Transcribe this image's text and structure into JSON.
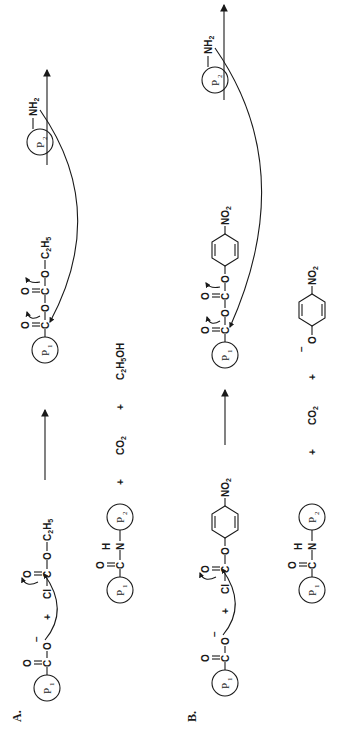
{
  "figure": {
    "orientation": "rotated-90-ccw",
    "panels": [
      {
        "label": "A.",
        "reactants": {
          "carboxylate": {
            "group": "P1",
            "formula": [
              "O",
              "C",
              "O",
              "−"
            ]
          },
          "plus": "+",
          "chloroformate": {
            "formula": [
              "Cl",
              "C",
              "O",
              "O",
              "C2H5"
            ],
            "name": "ethyl chloroformate"
          }
        },
        "intermediate": {
          "mixed_anhydride": {
            "group": "P1",
            "formula": [
              "O",
              "C",
              "O",
              "C",
              "O",
              "O",
              "C2H5"
            ]
          },
          "amine": {
            "group": "P2",
            "formula": "NH2"
          }
        },
        "products": {
          "amide": {
            "left_group": "P1",
            "right_group": "P2",
            "formula": [
              "O",
              "C",
              "N",
              "H"
            ]
          },
          "byproducts": [
            "CO2",
            "C2H5OH"
          ],
          "plus": "+"
        }
      },
      {
        "label": "B.",
        "reactants": {
          "carboxylate": {
            "group": "P1",
            "formula": [
              "O",
              "C",
              "O",
              "−"
            ]
          },
          "plus": "+",
          "chloroformate": {
            "formula": [
              "Cl",
              "C",
              "O",
              "O",
              "C6H4",
              "NO2"
            ],
            "name": "p-nitrophenyl chloroformate"
          }
        },
        "intermediate": {
          "mixed_anhydride": {
            "group": "P1",
            "formula": [
              "O",
              "C",
              "O",
              "C",
              "O",
              "O",
              "C6H4",
              "NO2"
            ]
          },
          "amine": {
            "group": "P2",
            "formula": "NH2"
          }
        },
        "products": {
          "amide": {
            "left_group": "P1",
            "right_group": "P2",
            "formula": [
              "O",
              "C",
              "N",
              "H"
            ]
          },
          "byproducts": [
            "CO2",
            "−O-C6H4-NO2"
          ],
          "plus": "+"
        }
      }
    ]
  },
  "labels": {
    "panelA": "A.",
    "panelB": "B.",
    "P": "P",
    "one": "1",
    "two": "2",
    "O": "O",
    "C": "C",
    "N": "N",
    "H": "H",
    "Cl": "Cl",
    "minus": "−",
    "plus": "+",
    "C2H5": {
      "C": "C",
      "2": "2",
      "H": "H",
      "5": "5"
    },
    "NH2": {
      "NH": "NH",
      "2": "2"
    },
    "NO2": {
      "NO": "NO",
      "2": "2"
    },
    "CO2": {
      "CO": "CO",
      "2": "2"
    },
    "C2H5OH": {
      "C": "C",
      "2": "2",
      "H": "H",
      "5": "5",
      "OH": "OH"
    }
  }
}
